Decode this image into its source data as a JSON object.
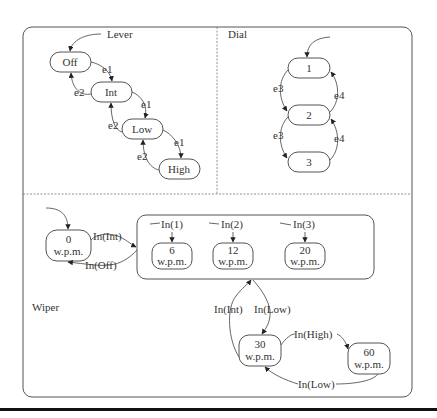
{
  "diagram": {
    "type": "statechart",
    "regions": {
      "lever": {
        "title": "Lever",
        "states": [
          "Off",
          "Int",
          "Low",
          "High"
        ],
        "initial": "Off",
        "transitions": [
          {
            "from": "Off",
            "to": "Int",
            "label": "e1"
          },
          {
            "from": "Int",
            "to": "Low",
            "label": "e1"
          },
          {
            "from": "Low",
            "to": "High",
            "label": "e1"
          },
          {
            "from": "Int",
            "to": "Off",
            "label": "e2"
          },
          {
            "from": "Low",
            "to": "Int",
            "label": "e2"
          },
          {
            "from": "High",
            "to": "Low",
            "label": "e2"
          }
        ]
      },
      "dial": {
        "title": "Dial",
        "states": [
          "1",
          "2",
          "3"
        ],
        "initial": "1",
        "transitions": [
          {
            "from": "1",
            "to": "2",
            "label": "e3"
          },
          {
            "from": "2",
            "to": "3",
            "label": "e3"
          },
          {
            "from": "2",
            "to": "1",
            "label": "e4"
          },
          {
            "from": "3",
            "to": "2",
            "label": "e4"
          }
        ]
      },
      "wiper": {
        "title": "Wiper",
        "states": {
          "s0": {
            "line1": "0",
            "line2": "w.p.m."
          },
          "s6": {
            "line1": "6",
            "line2": "w.p.m."
          },
          "s12": {
            "line1": "12",
            "line2": "w.p.m."
          },
          "s20": {
            "line1": "20",
            "line2": "w.p.m."
          },
          "s30": {
            "line1": "30",
            "line2": "w.p.m."
          },
          "s60": {
            "line1": "60",
            "line2": "w.p.m."
          }
        },
        "initial": "0 w.p.m.",
        "inner_entries": [
          "In(1)",
          "In(2)",
          "In(3)"
        ],
        "transitions": {
          "to_int": "In(Int)",
          "to_off": "In(Off)",
          "int_to_30": "In(Int)",
          "low_from_int": "In(Low)",
          "to_high": "In(High)",
          "high_to_low": "In(Low)"
        }
      }
    }
  }
}
